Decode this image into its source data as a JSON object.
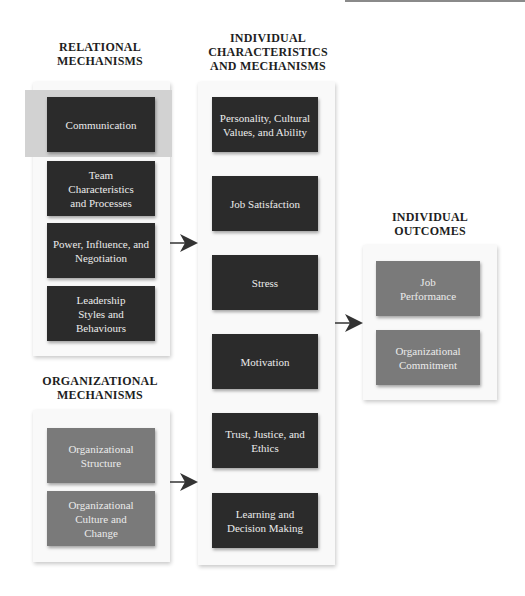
{
  "headings": {
    "relational": "RELATIONAL MECHANISMS",
    "individual": "INDIVIDUAL CHARACTERISTICS AND MECHANISMS",
    "outcomes": "INDIVIDUAL OUTCOMES",
    "organizational": "ORGANIZATIONAL MECHANISMS"
  },
  "heading_lines": {
    "relational": [
      "RELATIONAL",
      "MECHANISMS"
    ],
    "individual": [
      "INDIVIDUAL",
      "CHARACTERISTICS",
      "AND MECHANISMS"
    ],
    "outcomes": [
      "INDIVIDUAL",
      "OUTCOMES"
    ],
    "organizational": [
      "ORGANIZATIONAL",
      "MECHANISMS"
    ]
  },
  "relational_mechanisms": [
    {
      "label": "Communication",
      "highlighted": true
    },
    {
      "label": "Team Characteristics and Processes"
    },
    {
      "label": "Power, Influence, and Negotiation"
    },
    {
      "label": "Leadership Styles and Behaviours"
    }
  ],
  "organizational_mechanisms": [
    {
      "label": "Organizational Structure"
    },
    {
      "label": "Organizational Culture and Change"
    }
  ],
  "individual_characteristics": [
    {
      "label": "Personality, Cultural Values, and Ability"
    },
    {
      "label": "Job Satisfaction"
    },
    {
      "label": "Stress"
    },
    {
      "label": "Motivation"
    },
    {
      "label": "Trust, Justice, and Ethics"
    },
    {
      "label": "Learning and Decision Making"
    }
  ],
  "individual_outcomes": [
    {
      "label": "Job Performance"
    },
    {
      "label": "Organizational Commitment"
    }
  ],
  "colors": {
    "dark_box": "#2b2b2b",
    "mid_box": "#7a7a7a",
    "highlight": "#d2d2d2",
    "panel": "#f9f9f9",
    "arrow": "#333333"
  }
}
